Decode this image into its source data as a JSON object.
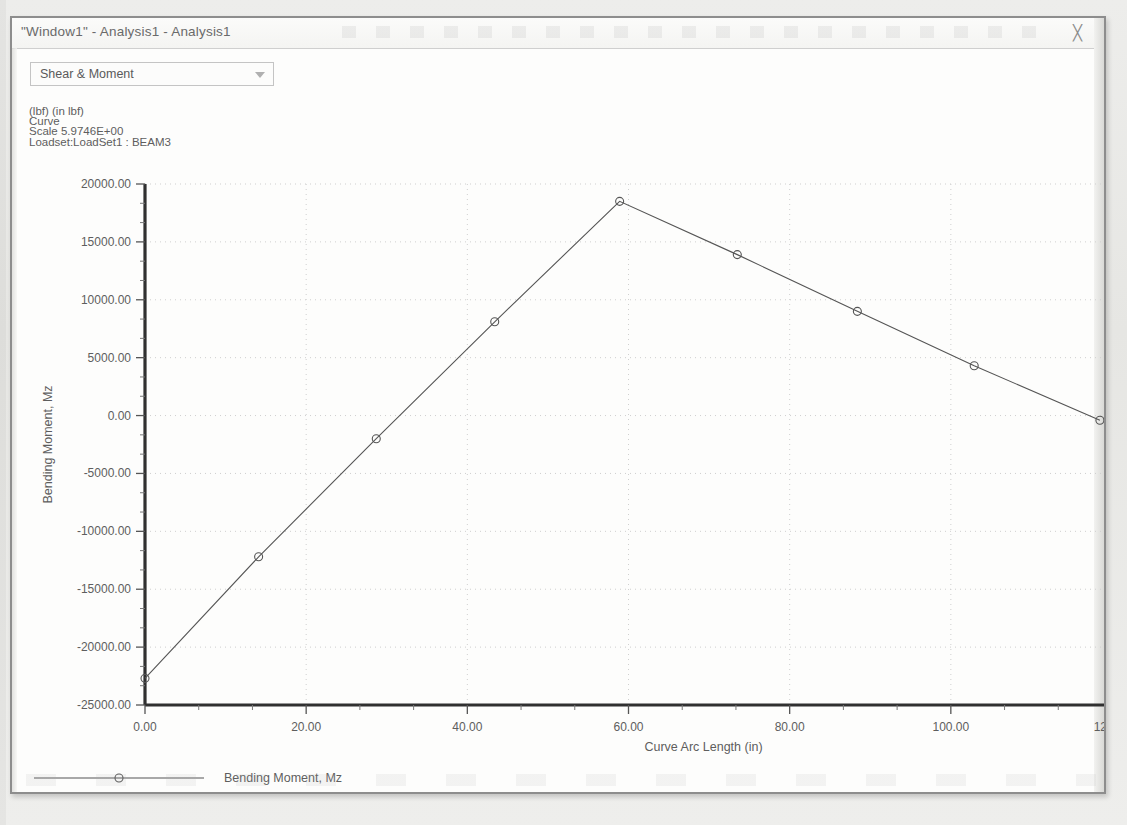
{
  "window": {
    "title": "\"Window1\" - Analysis1 - Analysis1",
    "close_icon": "close-icon",
    "close_glyph": "╳"
  },
  "toolbar": {
    "result_type_select": {
      "value": "Shear & Moment",
      "arrow_icon": "chevron-down-icon"
    }
  },
  "info_block": {
    "units": "(lbf)  (in lbf)",
    "entity": "Curve",
    "scale": "Scale 5.9746E+00",
    "loadset": "Loadset:LoadSet1 :  BEAM3"
  },
  "chart_data": {
    "type": "line",
    "title": "",
    "xlabel": "Curve Arc Length (in)",
    "ylabel": "Bending Moment, Mz",
    "xlim": [
      0,
      120
    ],
    "ylim": [
      -25000,
      20000
    ],
    "xticks": [
      0,
      20,
      40,
      60,
      80,
      100,
      120
    ],
    "xtick_labels": [
      "0.00",
      "20.00",
      "40.00",
      "60.00",
      "80.00",
      "100.00",
      "120.00"
    ],
    "yticks": [
      -25000,
      -20000,
      -15000,
      -10000,
      -5000,
      0,
      5000,
      10000,
      15000,
      20000
    ],
    "ytick_labels": [
      "-25000.00",
      "-20000.00",
      "-15000.00",
      "-10000.00",
      "-5000.00",
      "0.00",
      "5000.00",
      "10000.00",
      "15000.00",
      "20000.00"
    ],
    "minor_ticks_per_interval": 2,
    "grid": true,
    "grid_style": "dotted",
    "legend": {
      "position": "bottom-left",
      "entries": [
        {
          "name": "Bending Moment, Mz",
          "marker": "circle",
          "line": "solid",
          "color": "#555555"
        }
      ]
    },
    "series": [
      {
        "name": "Bending Moment, Mz",
        "color": "#555555",
        "marker": "circle",
        "x": [
          0,
          14.1,
          28.7,
          43.4,
          58.9,
          73.5,
          88.4,
          102.9,
          118.5
        ],
        "y": [
          -22700,
          -12200,
          -2000,
          8100,
          18500,
          13900,
          9000,
          4300,
          -400
        ]
      }
    ]
  }
}
